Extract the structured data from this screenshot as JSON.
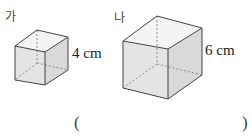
{
  "figures": [
    {
      "label": "가",
      "dimension": "4 cm"
    },
    {
      "label": "나",
      "dimension": "6 cm"
    }
  ],
  "answer": {
    "open": "(",
    "close": ")"
  },
  "colors": {
    "face_fill": "#e6e6e6",
    "edge": "#444444",
    "hidden_edge": "#777777"
  }
}
